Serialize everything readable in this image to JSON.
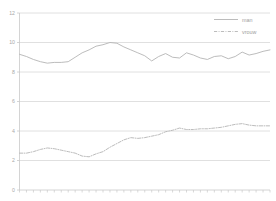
{
  "chart_data": {
    "type": "line",
    "title": "",
    "subtitle": "",
    "xlabel": "",
    "ylabel": "",
    "xlim": [
      0,
      36
    ],
    "ylim": [
      0,
      12
    ],
    "yticks": [
      0,
      2,
      4,
      6,
      8,
      10,
      12
    ],
    "ytick_labels": [
      "0",
      "2",
      "4",
      "6",
      "8",
      "10",
      "12"
    ],
    "xticks": [
      0,
      1,
      2,
      3,
      4,
      5,
      6,
      7,
      8,
      9,
      10,
      11,
      12,
      13,
      14,
      15,
      16,
      17,
      18,
      19,
      20,
      21,
      22,
      23,
      24,
      25,
      26,
      27,
      28,
      29,
      30,
      31,
      32,
      33,
      34,
      35,
      36
    ],
    "xtick_labels": [],
    "grid": true,
    "grid_axis": "y",
    "legend_position": "top-right",
    "x": [
      0,
      1,
      2,
      3,
      4,
      5,
      6,
      7,
      8,
      9,
      10,
      11,
      12,
      13,
      14,
      15,
      16,
      17,
      18,
      19,
      20,
      21,
      22,
      23,
      24,
      25,
      26,
      27,
      28,
      29,
      30,
      31,
      32,
      33,
      34,
      35,
      36
    ],
    "series": [
      {
        "name": "man",
        "style": "solid",
        "color": "#b4b4b4",
        "values": [
          9.2,
          9.05,
          8.85,
          8.7,
          8.6,
          8.65,
          8.65,
          8.7,
          9.0,
          9.3,
          9.5,
          9.75,
          9.85,
          10.0,
          9.95,
          9.7,
          9.5,
          9.3,
          9.1,
          8.75,
          9.05,
          9.25,
          9.0,
          8.95,
          9.3,
          9.15,
          8.95,
          8.85,
          9.05,
          9.1,
          8.9,
          9.05,
          9.35,
          9.15,
          9.25,
          9.4,
          9.5
        ]
      },
      {
        "name": "vrouw",
        "style": "dashdot",
        "color": "#b4b4b4",
        "values": [
          2.5,
          2.5,
          2.6,
          2.75,
          2.85,
          2.8,
          2.7,
          2.6,
          2.5,
          2.3,
          2.25,
          2.45,
          2.6,
          2.9,
          3.15,
          3.4,
          3.55,
          3.5,
          3.55,
          3.65,
          3.75,
          3.95,
          4.05,
          4.2,
          4.1,
          4.1,
          4.15,
          4.15,
          4.2,
          4.25,
          4.35,
          4.45,
          4.5,
          4.4,
          4.35,
          4.35,
          4.35
        ]
      }
    ],
    "series_tail": {
      "man_end": [
        9.7,
        10.05,
        10.1
      ],
      "vrouw_end": [
        4.35,
        4.3,
        4.3
      ]
    }
  },
  "legend": {
    "entries": [
      {
        "label": "man",
        "style": "solid",
        "color": "#b4b4b4"
      },
      {
        "label": "vrouw",
        "style": "dashdot",
        "color": "#b4b4b4"
      }
    ]
  },
  "axes": {
    "y_labels": [
      "12",
      "10",
      "8",
      "6",
      "4",
      "2",
      "0"
    ]
  },
  "colors": {
    "background": "#ffffff",
    "grid": "#d8d8d8",
    "axis": "#c9c9c9",
    "text": "#a9a9a9",
    "line": "#b4b4b4"
  }
}
